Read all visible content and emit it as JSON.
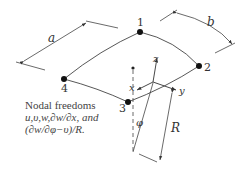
{
  "diagram": {
    "nodes": [
      {
        "id": "1",
        "label": "1"
      },
      {
        "id": "2",
        "label": "2"
      },
      {
        "id": "3",
        "label": "3"
      },
      {
        "id": "4",
        "label": "4"
      }
    ],
    "dimensions": {
      "a": "a",
      "b": "b",
      "R": "R",
      "phi": "φ"
    },
    "axes": {
      "x": "x",
      "y": "y",
      "z": "z"
    },
    "caption": {
      "line1": "Nodal freedoms",
      "line2": "u,υ,w,∂w/∂x, and",
      "line3": "(∂w/∂φ−υ)/R."
    }
  }
}
